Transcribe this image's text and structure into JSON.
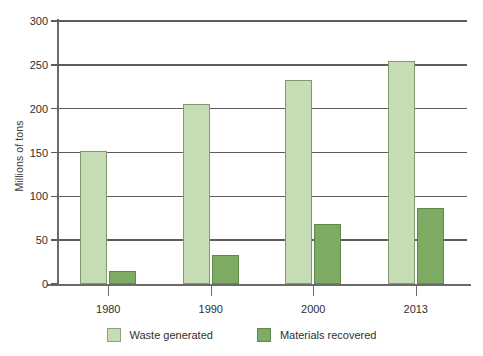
{
  "chart_data": {
    "type": "bar",
    "title": "",
    "subtitle": "",
    "xlabel": "",
    "ylabel": "Millions of tons",
    "categories": [
      "1980",
      "1990",
      "2000",
      "2013"
    ],
    "ylim": [
      0,
      300
    ],
    "yticks": [
      0,
      50,
      100,
      150,
      200,
      250,
      300
    ],
    "ytick_labels": [
      "0",
      "50",
      "100",
      "150",
      "200",
      "250",
      "300"
    ],
    "grid": true,
    "legend_position": "bottom",
    "series": [
      {
        "name": "Waste generated",
        "color": "#c6dcb4",
        "border_color": "#7f9b6e",
        "values": [
          152,
          205,
          233,
          254
        ]
      },
      {
        "name": "Materials recovered",
        "color": "#7dab63",
        "border_color": "#5f8a4b",
        "values": [
          15,
          33,
          69,
          87
        ]
      }
    ]
  },
  "legend": {
    "items": [
      {
        "label": "Waste generated",
        "swatch": "light"
      },
      {
        "label": "Materials recovered",
        "swatch": "dark"
      }
    ]
  },
  "colors": {
    "light_green": "#c6dcb4",
    "dark_green": "#7dab63",
    "axis": "#5d5d5d",
    "text": "#2f2f2f",
    "background": "#ffffff"
  }
}
